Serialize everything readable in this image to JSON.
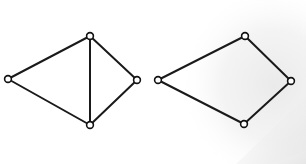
{
  "figure": {
    "width": 306,
    "height": 164,
    "background_color": "#ffffff",
    "paper_tint_color": "#ececed",
    "edge_color": "#1a1a1a",
    "node_stroke_color": "#111111",
    "node_fill_color": "#ffffff",
    "edge_width": 2.0,
    "node_radius": 3.4,
    "node_stroke_width": 1.6
  },
  "graphs": [
    {
      "name": "left-graph",
      "label": "left graph",
      "description": "Four vertices with a vertical chord, five edges",
      "node_count": 4,
      "edge_count": 5,
      "nodes": [
        {
          "id": "L0",
          "label": "left",
          "x": 8,
          "y": 79
        },
        {
          "id": "L1",
          "label": "top",
          "x": 90,
          "y": 36
        },
        {
          "id": "L2",
          "label": "right",
          "x": 137,
          "y": 80
        },
        {
          "id": "L3",
          "label": "bottom",
          "x": 90,
          "y": 125
        }
      ],
      "edges": [
        {
          "id": "L-e0",
          "from": "L0",
          "to": "L1",
          "label": "left-top"
        },
        {
          "id": "L-e1",
          "from": "L1",
          "to": "L2",
          "label": "top-right"
        },
        {
          "id": "L-e2",
          "from": "L2",
          "to": "L3",
          "label": "right-bottom"
        },
        {
          "id": "L-e3",
          "from": "L3",
          "to": "L0",
          "label": "bottom-left"
        },
        {
          "id": "L-e4",
          "from": "L1",
          "to": "L3",
          "label": "top-bottom-chord"
        }
      ]
    },
    {
      "name": "right-graph",
      "label": "right graph",
      "description": "Four vertices forming a simple quadrilateral cycle, four edges",
      "node_count": 4,
      "edge_count": 4,
      "nodes": [
        {
          "id": "R0",
          "label": "left",
          "x": 158,
          "y": 80
        },
        {
          "id": "R1",
          "label": "top",
          "x": 245,
          "y": 36
        },
        {
          "id": "R2",
          "label": "right",
          "x": 291,
          "y": 81
        },
        {
          "id": "R3",
          "label": "bottom",
          "x": 244,
          "y": 124
        }
      ],
      "edges": [
        {
          "id": "R-e0",
          "from": "R0",
          "to": "R1",
          "label": "left-top"
        },
        {
          "id": "R-e1",
          "from": "R1",
          "to": "R2",
          "label": "top-right"
        },
        {
          "id": "R-e2",
          "from": "R2",
          "to": "R3",
          "label": "right-bottom"
        },
        {
          "id": "R-e3",
          "from": "R3",
          "to": "R0",
          "label": "bottom-left"
        }
      ]
    }
  ]
}
